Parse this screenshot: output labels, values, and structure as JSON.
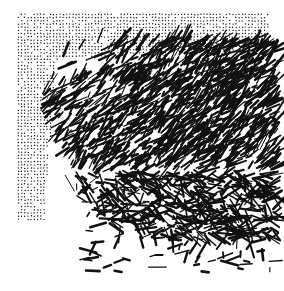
{
  "image": {
    "width": 284,
    "height": 291,
    "background": "#ffffff",
    "ink": "#111111",
    "dot_field": {
      "x0": 18,
      "y0": 14,
      "x1": 270,
      "y1": 60,
      "left_x1": 60,
      "left_y1": 220,
      "spacing": 3.2
    },
    "stroke_mass": {
      "center_x": 210,
      "center_y": 90,
      "radius": 170,
      "count": 2600,
      "seed": 7
    },
    "scatter_strokes": {
      "x0": 80,
      "y0": 190,
      "x1": 272,
      "y1": 272,
      "count": 90,
      "seed": 13
    }
  }
}
